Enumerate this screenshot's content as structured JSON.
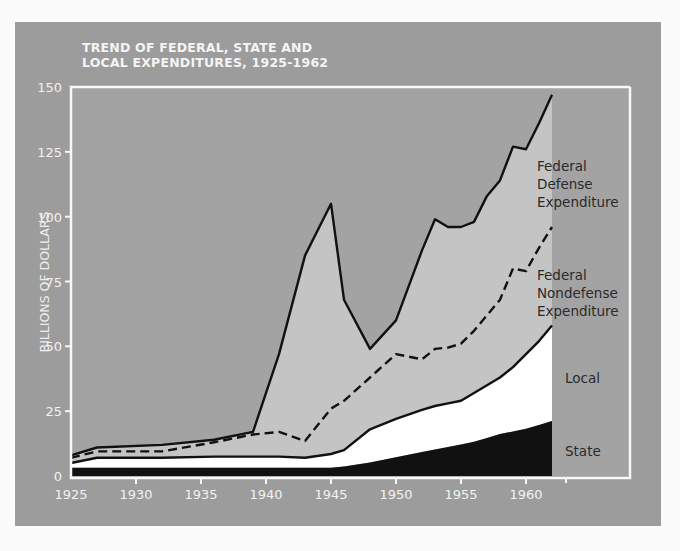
{
  "chart_data": {
    "type": "area",
    "title": "TREND OF FEDERAL, STATE AND LOCAL EXPENDITURES, 1925-1962",
    "title_lines": [
      "TREND OF FEDERAL, STATE AND",
      "LOCAL EXPENDITURES, 1925-1962"
    ],
    "xlabel": "",
    "ylabel": "BILLIONS OF DOLLARS",
    "xlim": [
      1925,
      1962
    ],
    "ylim": [
      0,
      150
    ],
    "x_ticks": [
      1925,
      1930,
      1935,
      1940,
      1945,
      1950,
      1955,
      1960
    ],
    "y_ticks": [
      0,
      25,
      50,
      75,
      100,
      125,
      150
    ],
    "stacked": true,
    "grid": false,
    "legend_position": "inline-right",
    "x": [
      1925,
      1927,
      1932,
      1936,
      1939,
      1941,
      1943,
      1945,
      1946,
      1948,
      1950,
      1952,
      1953,
      1954,
      1955,
      1956,
      1957,
      1958,
      1959,
      1960,
      1961,
      1962
    ],
    "series": [
      {
        "name": "State",
        "cumulative": true,
        "values": [
          2,
          2,
          2,
          2,
          2,
          2,
          2,
          2,
          2.5,
          4,
          6,
          8,
          9,
          10,
          11,
          12,
          13.5,
          15,
          16,
          17,
          18.5,
          20
        ]
      },
      {
        "name": "Local",
        "cumulative": true,
        "values": [
          5,
          7,
          7,
          7.5,
          7.5,
          7.5,
          7,
          8.5,
          10,
          18,
          22,
          25.5,
          27,
          28,
          29,
          32,
          35,
          38,
          42,
          47,
          52,
          58
        ]
      },
      {
        "name": "Federal Nondefense Expenditure",
        "cumulative": true,
        "style": "dashed",
        "values": [
          7,
          9.5,
          9.5,
          13,
          16,
          17,
          13.5,
          26,
          29,
          38,
          47,
          45,
          49,
          49.5,
          51,
          56,
          62,
          68,
          80,
          79,
          88,
          96
        ]
      },
      {
        "name": "Federal Defense Expenditure",
        "cumulative": true,
        "values": [
          8,
          11,
          12,
          14,
          17,
          47,
          85,
          105,
          68,
          49,
          60,
          87,
          99,
          96,
          96,
          98,
          108,
          114,
          127,
          126,
          136,
          147
        ]
      }
    ],
    "annotations": [
      "Federal Defense Expenditure",
      "Federal Nondefense Expenditure",
      "Local",
      "State"
    ]
  },
  "labels": {
    "federal_defense": [
      "Federal",
      "Defense",
      "Expenditure"
    ],
    "federal_nondefense": [
      "Federal",
      "Nondefense",
      "Expenditure"
    ],
    "local": "Local",
    "state": "State"
  },
  "colors": {
    "panel": "#9c9c9c",
    "plot_bg": "#a3a3a3",
    "federal_area": "#c4c4c4",
    "local_area": "#ffffff",
    "state_area": "#111111",
    "line": "#111111",
    "axis": "#f8f8f8"
  }
}
